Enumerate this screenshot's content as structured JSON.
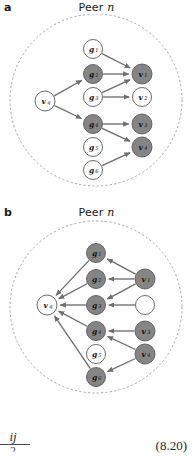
{
  "figure": {
    "equation_number": "(8.20)",
    "fraction_numerator": "ij",
    "fraction_denominator": "2"
  },
  "colors": {
    "node_dark_fill": "#858585",
    "node_light_fill": "#ffffff",
    "node_stroke": "#5a5a5a",
    "edge_color": "#6e6e6e",
    "boundary_color": "#9a9a9a",
    "text_color": "#111111"
  },
  "panels": [
    {
      "id": "a",
      "label": "a",
      "title_prefix": "Peer ",
      "title_italic": "n",
      "boundary": {
        "cx": 96,
        "cy": 86,
        "r": 86,
        "style": "dashed"
      },
      "nodes": [
        {
          "id": "vq",
          "label": "v",
          "sub": "q",
          "cx": 45,
          "cy": 87,
          "r": 10,
          "fill": "light"
        },
        {
          "id": "g1",
          "label": "g",
          "sub": "1",
          "cx": 93,
          "cy": 35,
          "r": 9.5,
          "fill": "light"
        },
        {
          "id": "g2",
          "label": "g",
          "sub": "2",
          "cx": 93,
          "cy": 60,
          "r": 9.5,
          "fill": "dark"
        },
        {
          "id": "g3",
          "label": "g",
          "sub": "3",
          "cx": 93,
          "cy": 83,
          "r": 9.5,
          "fill": "light"
        },
        {
          "id": "g4",
          "label": "g",
          "sub": "4",
          "cx": 93,
          "cy": 110,
          "r": 9.5,
          "fill": "dark"
        },
        {
          "id": "g5",
          "label": "g",
          "sub": "5",
          "cx": 93,
          "cy": 133,
          "r": 9.5,
          "fill": "light"
        },
        {
          "id": "g6",
          "label": "g",
          "sub": "6",
          "cx": 93,
          "cy": 156,
          "r": 9.5,
          "fill": "light"
        },
        {
          "id": "v1",
          "label": "v",
          "sub": "1",
          "cx": 142,
          "cy": 60,
          "r": 10,
          "fill": "dark"
        },
        {
          "id": "v2",
          "label": "v",
          "sub": "2",
          "cx": 142,
          "cy": 83,
          "r": 9.5,
          "fill": "light"
        },
        {
          "id": "v3",
          "label": "v",
          "sub": "3",
          "cx": 142,
          "cy": 110,
          "r": 10,
          "fill": "dark"
        },
        {
          "id": "v4",
          "label": "v",
          "sub": "4",
          "cx": 142,
          "cy": 133,
          "r": 10,
          "fill": "dark"
        }
      ],
      "edges": [
        {
          "from": "vq",
          "to": "g2"
        },
        {
          "from": "vq",
          "to": "g4"
        },
        {
          "from": "g1",
          "to": "v1"
        },
        {
          "from": "g2",
          "to": "v1"
        },
        {
          "from": "g3",
          "to": "v1"
        },
        {
          "from": "g3",
          "to": "v2"
        },
        {
          "from": "g4",
          "to": "v3"
        },
        {
          "from": "g4",
          "to": "v4"
        },
        {
          "from": "g6",
          "to": "v4"
        }
      ]
    },
    {
      "id": "b",
      "label": "b",
      "title_prefix": "Peer ",
      "title_italic": "n",
      "boundary": {
        "cx": 96,
        "cy": 88,
        "r": 86,
        "style": "dashed"
      },
      "nodes": [
        {
          "id": "vq",
          "label": "v",
          "sub": "q",
          "cx": 47,
          "cy": 86,
          "r": 10,
          "fill": "light"
        },
        {
          "id": "g1",
          "label": "g",
          "sub": "1",
          "cx": 96,
          "cy": 34,
          "r": 9.5,
          "fill": "dark"
        },
        {
          "id": "g2",
          "label": "g",
          "sub": "2",
          "cx": 96,
          "cy": 60,
          "r": 9.5,
          "fill": "dark"
        },
        {
          "id": "g3",
          "label": "g",
          "sub": "3",
          "cx": 96,
          "cy": 86,
          "r": 9.5,
          "fill": "dark"
        },
        {
          "id": "g4",
          "label": "g",
          "sub": "4",
          "cx": 96,
          "cy": 112,
          "r": 9.5,
          "fill": "dark"
        },
        {
          "id": "g5",
          "label": "g",
          "sub": "5",
          "cx": 96,
          "cy": 135,
          "r": 9.5,
          "fill": "light"
        },
        {
          "id": "g6",
          "label": "g",
          "sub": "6",
          "cx": 96,
          "cy": 158,
          "r": 9.5,
          "fill": "dark"
        },
        {
          "id": "v1",
          "label": "v",
          "sub": "1",
          "cx": 145,
          "cy": 60,
          "r": 10,
          "fill": "dark"
        },
        {
          "id": "vu",
          "label": "",
          "sub": "",
          "cx": 145,
          "cy": 86,
          "r": 9.5,
          "fill": "light"
        },
        {
          "id": "v3",
          "label": "v",
          "sub": "3",
          "cx": 145,
          "cy": 112,
          "r": 10,
          "fill": "dark"
        },
        {
          "id": "v4",
          "label": "v",
          "sub": "4",
          "cx": 145,
          "cy": 135,
          "r": 10,
          "fill": "dark"
        }
      ],
      "edges": [
        {
          "from": "v1",
          "to": "g1"
        },
        {
          "from": "v1",
          "to": "g2"
        },
        {
          "from": "v1",
          "to": "g3"
        },
        {
          "from": "vu",
          "to": "g3"
        },
        {
          "from": "v3",
          "to": "g4"
        },
        {
          "from": "v4",
          "to": "g4"
        },
        {
          "from": "v4",
          "to": "g6"
        },
        {
          "from": "g1",
          "to": "vq"
        },
        {
          "from": "g2",
          "to": "vq"
        },
        {
          "from": "g3",
          "to": "vq"
        },
        {
          "from": "g4",
          "to": "vq"
        },
        {
          "from": "g6",
          "to": "vq"
        }
      ]
    }
  ]
}
